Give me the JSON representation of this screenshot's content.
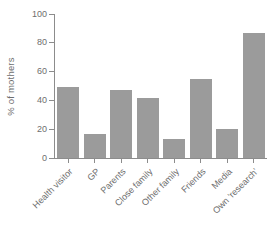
{
  "chart_data": {
    "type": "bar",
    "categories": [
      "Health visitor",
      "GP",
      "Parents",
      "Close family",
      "Other family",
      "Friends",
      "Media",
      "Own 'research'"
    ],
    "values": [
      49,
      17,
      47,
      42,
      13,
      55,
      20,
      87
    ],
    "title": "",
    "xlabel": "",
    "ylabel": "% of mothers",
    "ylim": [
      0,
      100
    ],
    "yticks": [
      0,
      20,
      40,
      60,
      80,
      100
    ],
    "grid": false,
    "legend": false,
    "bar_color": "#9b9b9b",
    "axis_color": "#8c8c8c",
    "text_color": "#6e6e6e"
  }
}
